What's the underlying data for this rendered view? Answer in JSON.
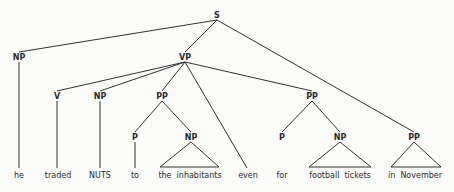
{
  "diagram": {
    "type": "syntax-tree",
    "nodes": {
      "S": "S",
      "NP_subject": "NP",
      "VP": "VP",
      "V": "V",
      "NP_object": "NP",
      "PP_to": "PP",
      "P_to": "P",
      "NP_to": "NP",
      "PP_for": "PP",
      "P_for": "P",
      "NP_for": "NP",
      "PP_in": "PP"
    },
    "leaves": {
      "he": "he",
      "traded": "traded",
      "nuts": "NUTS",
      "to": "to",
      "the_inhabitants": "the  inhabitants",
      "even": "even",
      "for": "for",
      "football_tickets": "football  tickets",
      "in_november": "in  November"
    },
    "edges": [
      [
        "S",
        "NP_subject"
      ],
      [
        "S",
        "VP"
      ],
      [
        "S",
        "PP_in"
      ],
      [
        "VP",
        "V"
      ],
      [
        "VP",
        "NP_object"
      ],
      [
        "VP",
        "PP_to"
      ],
      [
        "VP",
        "even"
      ],
      [
        "VP",
        "PP_for"
      ],
      [
        "PP_to",
        "P_to"
      ],
      [
        "PP_to",
        "NP_to"
      ],
      [
        "PP_for",
        "P_for"
      ],
      [
        "PP_for",
        "NP_for"
      ]
    ]
  }
}
